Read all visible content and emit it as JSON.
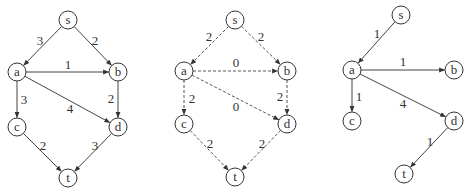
{
  "figure": {
    "graphs": [
      {
        "id": "capacity-graph",
        "edge_style": "solid",
        "nodes": [
          {
            "id": "s",
            "label": "s",
            "x": 68,
            "y": 20
          },
          {
            "id": "a",
            "label": "a",
            "x": 17,
            "y": 72
          },
          {
            "id": "b",
            "label": "b",
            "x": 118,
            "y": 72
          },
          {
            "id": "c",
            "label": "c",
            "x": 17,
            "y": 127
          },
          {
            "id": "d",
            "label": "d",
            "x": 118,
            "y": 127
          },
          {
            "id": "t",
            "label": "t",
            "x": 68,
            "y": 178
          }
        ],
        "edges": [
          {
            "from": "s",
            "to": "a",
            "label": "3",
            "lx": 40,
            "ly": 40
          },
          {
            "from": "s",
            "to": "b",
            "label": "2",
            "lx": 95,
            "ly": 40
          },
          {
            "from": "a",
            "to": "b",
            "label": "1",
            "lx": 68,
            "ly": 64
          },
          {
            "from": "a",
            "to": "c",
            "label": "3",
            "lx": 24,
            "ly": 99
          },
          {
            "from": "a",
            "to": "d",
            "label": "4",
            "lx": 70,
            "ly": 108
          },
          {
            "from": "b",
            "to": "d",
            "label": "2",
            "lx": 111,
            "ly": 98
          },
          {
            "from": "c",
            "to": "t",
            "label": "2",
            "lx": 43,
            "ly": 145
          },
          {
            "from": "d",
            "to": "t",
            "label": "3",
            "lx": 95,
            "ly": 145
          }
        ]
      },
      {
        "id": "flow-graph",
        "edge_style": "dashed",
        "nodes": [
          {
            "id": "s",
            "label": "s",
            "x": 235,
            "y": 20
          },
          {
            "id": "a",
            "label": "a",
            "x": 184,
            "y": 71
          },
          {
            "id": "b",
            "label": "b",
            "x": 287,
            "y": 71
          },
          {
            "id": "c",
            "label": "c",
            "x": 184,
            "y": 124
          },
          {
            "id": "d",
            "label": "d",
            "x": 287,
            "y": 124
          },
          {
            "id": "t",
            "label": "t",
            "x": 235,
            "y": 177
          }
        ],
        "edges": [
          {
            "from": "s",
            "to": "a",
            "label": "2",
            "lx": 209,
            "ly": 36
          },
          {
            "from": "s",
            "to": "b",
            "label": "2",
            "lx": 261,
            "ly": 36
          },
          {
            "from": "a",
            "to": "b",
            "label": "0",
            "lx": 236,
            "ly": 62
          },
          {
            "from": "a",
            "to": "c",
            "label": "2",
            "lx": 192,
            "ly": 98
          },
          {
            "from": "a",
            "to": "d",
            "label": "0",
            "lx": 236,
            "ly": 106
          },
          {
            "from": "b",
            "to": "d",
            "label": "2",
            "lx": 280,
            "ly": 96
          },
          {
            "from": "c",
            "to": "t",
            "label": "2",
            "lx": 210,
            "ly": 143
          },
          {
            "from": "d",
            "to": "t",
            "label": "2",
            "lx": 262,
            "ly": 143
          }
        ]
      },
      {
        "id": "result-graph",
        "edge_style": "solid",
        "nodes": [
          {
            "id": "s",
            "label": "s",
            "x": 401,
            "y": 15
          },
          {
            "id": "a",
            "label": "a",
            "x": 352,
            "y": 70
          },
          {
            "id": "b",
            "label": "b",
            "x": 454,
            "y": 70
          },
          {
            "id": "c",
            "label": "c",
            "x": 352,
            "y": 121
          },
          {
            "id": "d",
            "label": "d",
            "x": 454,
            "y": 121
          },
          {
            "id": "t",
            "label": "t",
            "x": 404,
            "y": 174
          }
        ],
        "edges": [
          {
            "from": "s",
            "to": "a",
            "label": "1",
            "lx": 377,
            "ly": 33
          },
          {
            "from": "a",
            "to": "b",
            "label": "1",
            "lx": 403,
            "ly": 61
          },
          {
            "from": "a",
            "to": "c",
            "label": "1",
            "lx": 359,
            "ly": 96
          },
          {
            "from": "a",
            "to": "d",
            "label": "4",
            "lx": 403,
            "ly": 103
          },
          {
            "from": "d",
            "to": "t",
            "label": "1",
            "lx": 430,
            "ly": 141
          }
        ]
      }
    ],
    "node_radius": 9,
    "colors": {
      "stroke": "#333333",
      "background": "#ffffff"
    }
  }
}
